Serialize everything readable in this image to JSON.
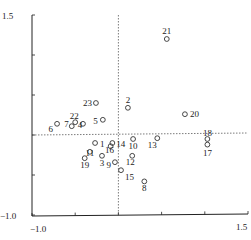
{
  "chart_data": {
    "type": "scatter",
    "title": "",
    "xlabel": "",
    "ylabel": "",
    "xlim": [
      -1.0,
      1.5
    ],
    "ylim": [
      -1.0,
      1.5
    ],
    "x_tick_labels": [
      "-1.0",
      "1.5"
    ],
    "y_tick_labels": [
      "1.5",
      "-1.0"
    ],
    "x_ticks": [
      -1.0,
      -0.5,
      0.0,
      0.5,
      1.0,
      1.5
    ],
    "y_ticks": [
      -1.0,
      -0.5,
      0.0,
      0.5,
      1.0,
      1.5
    ],
    "reference_lines": {
      "x": 0.0,
      "y": 0.0,
      "style": "dashed"
    },
    "grid": false,
    "legend": null,
    "points": [
      {
        "label": "1",
        "x": -0.27,
        "y": -0.1
      },
      {
        "label": "2",
        "x": 0.11,
        "y": 0.34
      },
      {
        "label": "3",
        "x": -0.19,
        "y": -0.26
      },
      {
        "label": "4",
        "x": -0.41,
        "y": 0.14
      },
      {
        "label": "5",
        "x": -0.18,
        "y": 0.19
      },
      {
        "label": "6",
        "x": -0.71,
        "y": 0.14
      },
      {
        "label": "7",
        "x": -0.54,
        "y": 0.11
      },
      {
        "label": "8",
        "x": 0.3,
        "y": -0.58
      },
      {
        "label": "9",
        "x": -0.04,
        "y": -0.34
      },
      {
        "label": "10",
        "x": 0.17,
        "y": -0.05
      },
      {
        "label": "11",
        "x": -0.33,
        "y": -0.21
      },
      {
        "label": "12",
        "x": 0.16,
        "y": -0.26
      },
      {
        "label": "13",
        "x": 0.45,
        "y": -0.04
      },
      {
        "label": "14",
        "x": -0.07,
        "y": -0.1
      },
      {
        "label": "15",
        "x": 0.03,
        "y": -0.44
      },
      {
        "label": "16",
        "x": -0.09,
        "y": -0.14
      },
      {
        "label": "17",
        "x": 1.03,
        "y": -0.12
      },
      {
        "label": "18",
        "x": 1.03,
        "y": -0.05
      },
      {
        "label": "19",
        "x": -0.39,
        "y": -0.29
      },
      {
        "label": "20",
        "x": 0.77,
        "y": 0.26
      },
      {
        "label": "21",
        "x": 0.56,
        "y": 1.2
      },
      {
        "label": "22",
        "x": -0.5,
        "y": 0.16
      },
      {
        "label": "23",
        "x": -0.26,
        "y": 0.4
      }
    ],
    "label_offsets": {
      "1": [
        5,
        4,
        "start"
      ],
      "2": [
        0,
        -5,
        "middle"
      ],
      "3": [
        0,
        10,
        "middle"
      ],
      "4": [
        -3,
        4,
        "middle"
      ],
      "5": [
        -5,
        4,
        "end"
      ],
      "6": [
        -4,
        8,
        "end"
      ],
      "7": [
        -3,
        1,
        "end"
      ],
      "8": [
        0,
        10,
        "middle"
      ],
      "9": [
        -4,
        6,
        "end"
      ],
      "10": [
        0,
        10,
        "middle"
      ],
      "11": [
        0,
        4,
        "middle"
      ],
      "12": [
        -2,
        9,
        "middle"
      ],
      "13": [
        -5,
        10,
        "middle"
      ],
      "14": [
        4,
        4,
        "start"
      ],
      "15": [
        4,
        10,
        "start"
      ],
      "16": [
        -1,
        7,
        "middle"
      ],
      "17": [
        0,
        11,
        "middle"
      ],
      "18": [
        0,
        -3,
        "middle"
      ],
      "19": [
        0,
        10,
        "middle"
      ],
      "20": [
        5,
        3,
        "start"
      ],
      "21": [
        0,
        -5,
        "middle"
      ],
      "22": [
        -1,
        -3,
        "middle"
      ],
      "23": [
        -4,
        3,
        "end"
      ]
    }
  }
}
